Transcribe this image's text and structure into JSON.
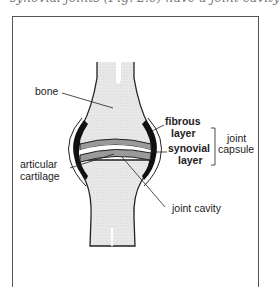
{
  "caption_fragment": "synovial joints (Fig. 2.6) have a joint cavity",
  "diagram": {
    "title": "Synovial joint",
    "labels": {
      "bone": "bone",
      "fibrous_layer": [
        "fibrous",
        "layer"
      ],
      "synovial_layer": [
        "synovial",
        "layer"
      ],
      "joint_capsule": [
        "joint",
        "capsule"
      ],
      "articular_cartilage": [
        "articular",
        "cartilage"
      ],
      "joint_cavity": "joint cavity"
    },
    "colors": {
      "bone": "#e4e4e4",
      "outline": "#222222",
      "capsule": "#111111",
      "cartilage": "#9a9a9a",
      "frame": "#555555"
    }
  }
}
